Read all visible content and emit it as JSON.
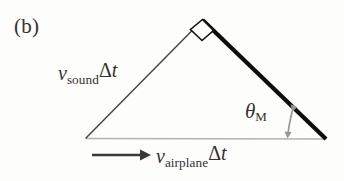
{
  "figure": {
    "panel_label": "(b)",
    "background_color": "#fdfdfb",
    "labels": {
      "sound_var": "v",
      "sound_sub": "sound",
      "sound_delta": "Δ",
      "sound_t": "t",
      "airplane_var": "v",
      "airplane_sub": "airplane",
      "airplane_delta": "Δ",
      "airplane_t": "t",
      "angle_symbol": "θ",
      "angle_sub": "M"
    },
    "geometry": {
      "apex": [
        202,
        20
      ],
      "left_vertex": [
        86,
        138
      ],
      "right_vertex": [
        326,
        139
      ],
      "right_angle_marker_size": 13
    },
    "strokes": {
      "left_edge_color": "#4a4846",
      "left_edge_width": 1.5,
      "hypotenuse_color": "#0d0d0d",
      "hypotenuse_width": 4.2,
      "base_color": "#b5b2ae",
      "base_width": 1.4,
      "right_angle_color": "#111111",
      "velocity_arrow_color": "#3a3836",
      "angle_arrow_color": "#9a9793"
    },
    "velocity_arrow": {
      "x_start": 92,
      "x_end": 148,
      "y": 155
    },
    "angle_arrow": {
      "x_top": 294,
      "y_top": 104,
      "x_bottom": 288,
      "y_bottom": 137
    }
  }
}
